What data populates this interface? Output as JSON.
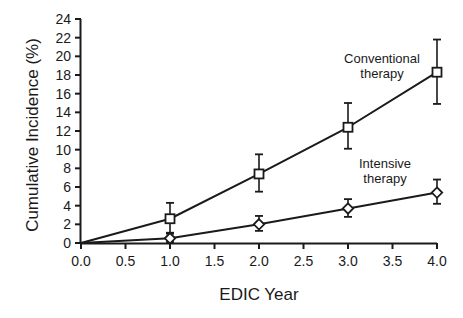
{
  "chart_data": {
    "type": "line",
    "title": "",
    "xlabel": "EDIC Year",
    "ylabel": "Cumulative Incidence (%)",
    "xlim": [
      0.0,
      4.0
    ],
    "ylim": [
      0,
      24
    ],
    "xticks": [
      "0.0",
      "0.5",
      "1.0",
      "1.5",
      "2.0",
      "2.5",
      "3.0",
      "3.5",
      "4.0"
    ],
    "xtick_values": [
      0.0,
      0.5,
      1.0,
      1.5,
      2.0,
      2.5,
      3.0,
      3.5,
      4.0
    ],
    "yticks": [
      "0",
      "2",
      "4",
      "6",
      "8",
      "10",
      "12",
      "14",
      "16",
      "18",
      "20",
      "22",
      "24"
    ],
    "ytick_values": [
      0,
      2,
      4,
      6,
      8,
      10,
      12,
      14,
      16,
      18,
      20,
      22,
      24
    ],
    "grid": false,
    "legend_position": "inline-annotation",
    "series": [
      {
        "name": "Conventional therapy",
        "marker": "square",
        "label_line1": "Conventional",
        "label_line2": "therapy",
        "x": [
          0.0,
          1.0,
          2.0,
          3.0,
          4.0
        ],
        "values": [
          0.0,
          2.6,
          7.4,
          12.4,
          18.3
        ],
        "err_low": [
          0.0,
          1.0,
          5.5,
          10.1,
          14.9
        ],
        "err_high": [
          0.0,
          4.3,
          9.5,
          15.0,
          21.8
        ]
      },
      {
        "name": "Intensive therapy",
        "marker": "diamond",
        "label_line1": "Intensive",
        "label_line2": "therapy",
        "x": [
          0.0,
          1.0,
          2.0,
          3.0,
          4.0
        ],
        "values": [
          0.0,
          0.5,
          2.0,
          3.7,
          5.4
        ],
        "err_low": [
          0.0,
          0.1,
          1.3,
          2.8,
          4.2
        ],
        "err_high": [
          0.0,
          1.1,
          2.9,
          4.7,
          6.8
        ]
      }
    ]
  },
  "colors": {
    "axis": "#1a1a1a",
    "series_conventional": "#1a1a1a",
    "series_intensive": "#1a1a1a",
    "background": "#ffffff"
  },
  "annotations": {
    "conventional_line1": "Conventional",
    "conventional_line2": "therapy",
    "intensive_line1": "Intensive",
    "intensive_line2": "therapy"
  }
}
